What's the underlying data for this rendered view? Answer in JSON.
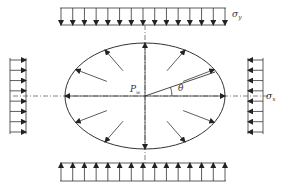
{
  "diagram": {
    "type": "stress-loading-schematic",
    "colors": {
      "stroke": "#333333",
      "axis": "#666666",
      "background": "#ffffff"
    },
    "ellipse": {
      "cx": 145,
      "cy": 96,
      "rx": 80,
      "ry": 53
    },
    "labels": {
      "sigma_y": {
        "symbol": "σ",
        "subscript": "y"
      },
      "sigma_x": {
        "symbol": "σ",
        "subscript": "x"
      },
      "pressure": {
        "symbol": "P",
        "subscript": "w"
      },
      "angle": {
        "symbol": "θ"
      }
    },
    "loads": {
      "top": {
        "direction": "down",
        "arrow_count": 15,
        "x_start": 60,
        "x_end": 226,
        "y_top": 8,
        "y_bottom": 25
      },
      "bottom": {
        "direction": "up",
        "arrow_count": 15,
        "x_start": 60,
        "x_end": 226,
        "y_top": 163,
        "y_bottom": 181
      },
      "left": {
        "direction": "right",
        "arrow_count": 8,
        "y_start": 58,
        "y_end": 134,
        "x_left": 10,
        "x_right": 26
      },
      "right": {
        "direction": "left",
        "arrow_count": 8,
        "y_start": 58,
        "y_end": 134,
        "x_left": 248,
        "x_right": 263
      }
    },
    "internal_pressure_arrows": {
      "count": 12,
      "direction": "outward-normal"
    }
  }
}
